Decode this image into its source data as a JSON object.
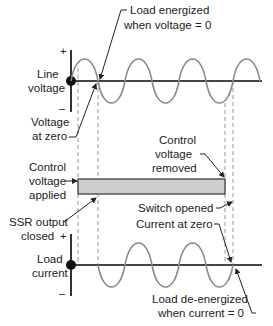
{
  "figure": {
    "line_voltage": {
      "label_line1": "Line",
      "label_line2": "voltage",
      "plus": "+",
      "minus": "–"
    },
    "load_current": {
      "label_line1": "Load",
      "label_line2": "current",
      "plus": "+",
      "minus": "–"
    },
    "annotations": {
      "load_energized_1": "Load energized",
      "load_energized_2": "when voltage = 0",
      "voltage_at_zero_1": "Voltage",
      "voltage_at_zero_2": "at zero",
      "control_applied_1": "Control",
      "control_applied_2": "voltage",
      "control_applied_3": "applied",
      "control_removed_1": "Control",
      "control_removed_2": "voltage",
      "control_removed_3": "removed",
      "ssr_closed_1": "SSR output",
      "ssr_closed_2": "closed",
      "switch_opened": "Switch opened",
      "current_at_zero": "Current at zero",
      "load_deenergized_1": "Load de-energized",
      "load_deenergized_2": "when current = 0"
    },
    "colors": {
      "axis": "#333333",
      "wave": "#8a8a8a",
      "dashed": "#999999",
      "bar_fill": "#cfcfcf",
      "bar_stroke": "#333333"
    }
  }
}
